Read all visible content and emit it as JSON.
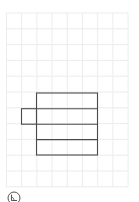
{
  "canvas": {
    "width": 139,
    "height": 202,
    "background": "#ffffff"
  },
  "grid": {
    "origin_x": 6.5,
    "origin_y": 13,
    "columns": 8,
    "rows": 11,
    "cell_width": 15.2,
    "cell_height": 15.8,
    "line_color": "#ececec"
  },
  "shapes": {
    "stroke_color": "#4a4a4a",
    "main_rectangle": {
      "x": 36.5,
      "y": 93,
      "width": 61,
      "height": 62
    },
    "row_dividers_y": [
      108.7,
      124.2,
      139.6
    ],
    "side_tab": {
      "x": 21.5,
      "y": 108.7,
      "width": 15,
      "height": 15.5
    }
  },
  "toolbar": {
    "icon": "angle-tool-icon"
  }
}
